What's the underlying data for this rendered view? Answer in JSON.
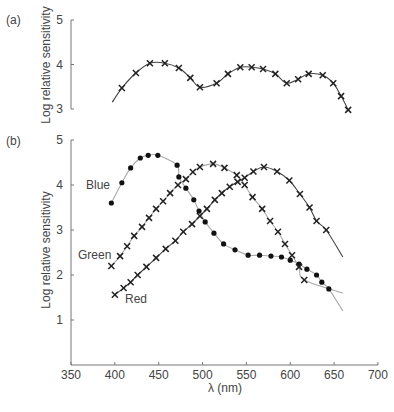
{
  "chart_data": [
    {
      "type": "line",
      "panel": "(a)",
      "title": "",
      "xlabel": "λ (nm)",
      "ylabel": "Log relative sensitivity",
      "xlim": [
        350,
        700
      ],
      "ylim": [
        3,
        5
      ],
      "yticks": [
        3,
        4,
        5
      ],
      "grid": false,
      "legend": null,
      "series": [
        {
          "name": "Overall sensitivity",
          "marker": "x",
          "line_color": "#444444",
          "curve_start": [
            397,
            3.15
          ],
          "x": [
            408,
            424,
            440,
            457,
            473,
            486,
            497,
            516,
            529,
            543,
            556,
            569,
            583,
            596,
            609,
            621,
            637,
            649,
            658,
            666
          ],
          "y": [
            3.47,
            3.81,
            4.03,
            4.03,
            3.92,
            3.7,
            3.49,
            3.58,
            3.79,
            3.94,
            3.94,
            3.9,
            3.79,
            3.58,
            3.67,
            3.79,
            3.76,
            3.58,
            3.29,
            2.98
          ]
        }
      ]
    },
    {
      "type": "line",
      "panel": "(b)",
      "title": "",
      "xlabel": "λ (nm)",
      "ylabel": "Log relative sensitivity",
      "xlim": [
        350,
        700
      ],
      "xticks": [
        350,
        400,
        450,
        500,
        550,
        600,
        650,
        700
      ],
      "ylim": [
        0,
        5
      ],
      "yticks": [
        1,
        2,
        3,
        4,
        5
      ],
      "grid": false,
      "legend": "inline labels",
      "series": [
        {
          "name": "Blue",
          "marker": "dot",
          "line_color": "#aaaaaa",
          "curve_end": [
            660,
            1.2
          ],
          "x": [
            396,
            408,
            418,
            429,
            438,
            449,
            471,
            473,
            481,
            490,
            496,
            503,
            513,
            524,
            537,
            552,
            565,
            578,
            590,
            600,
            610,
            619,
            630,
            636,
            644
          ],
          "y": [
            3.6,
            4.05,
            4.38,
            4.6,
            4.66,
            4.66,
            4.44,
            4.18,
            3.93,
            3.67,
            3.42,
            3.18,
            2.93,
            2.69,
            2.56,
            2.44,
            2.44,
            2.42,
            2.4,
            2.33,
            2.24,
            2.13,
            2.0,
            1.84,
            1.69
          ]
        },
        {
          "name": "Green",
          "marker": "x",
          "line_color": "#aaaaaa",
          "curve_end": [
            660,
            1.6
          ],
          "x": [
            396,
            406,
            414,
            422,
            431,
            439,
            447,
            455,
            463,
            472,
            481,
            489,
            497,
            512,
            525,
            539,
            548,
            557,
            568,
            577,
            586,
            594,
            602,
            610,
            616
          ],
          "y": [
            2.2,
            2.42,
            2.64,
            2.87,
            3.07,
            3.27,
            3.47,
            3.64,
            3.82,
            4.0,
            4.13,
            4.29,
            4.4,
            4.47,
            4.38,
            4.22,
            4.0,
            3.73,
            3.47,
            3.2,
            2.96,
            2.69,
            2.44,
            2.18,
            1.89
          ]
        },
        {
          "name": "Red",
          "marker": "x",
          "line_color": "#444444",
          "curve_end": [
            660,
            2.4
          ],
          "x": [
            400,
            410,
            418,
            426,
            436,
            447,
            458,
            469,
            478,
            488,
            497,
            505,
            514,
            522,
            531,
            540,
            548,
            558,
            570,
            585,
            599,
            611,
            622,
            630,
            641
          ],
          "y": [
            1.56,
            1.71,
            1.84,
            2.0,
            2.18,
            2.38,
            2.58,
            2.76,
            2.96,
            3.13,
            3.31,
            3.47,
            3.67,
            3.82,
            3.96,
            4.07,
            4.16,
            4.3,
            4.4,
            4.3,
            4.1,
            3.8,
            3.5,
            3.2,
            3.0
          ]
        }
      ]
    }
  ],
  "labels": {
    "panel_a": "(a)",
    "panel_b": "(b)",
    "ylabel": "Log relative sensitivity",
    "xlabel": "λ (nm)",
    "blue": "Blue",
    "green": "Green",
    "red": "Red"
  },
  "ticks": {
    "a_y": [
      "5",
      "4",
      "3"
    ],
    "b_y": [
      "5",
      "4",
      "3",
      "2",
      "1"
    ],
    "x": [
      "350",
      "400",
      "450",
      "500",
      "550",
      "600",
      "650",
      "700"
    ]
  },
  "colors": {
    "axis": "#777777",
    "dark_line": "#444444",
    "grey_line": "#aaaaaa",
    "marker": "#111111"
  }
}
